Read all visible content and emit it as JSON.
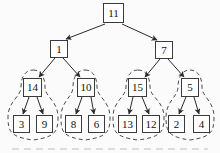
{
  "colors": {
    "ink": "#2a2a2a",
    "box_border": "#3b3b3b",
    "background": "#fbfbfb",
    "group_outline": "#4a4a4a"
  },
  "tree": {
    "type": "binary-tree-diagram",
    "nodes": {
      "n11": "11",
      "n1": "1",
      "n7": "7",
      "n14": "14",
      "n10": "10",
      "n15": "15",
      "n5": "5",
      "n3": "3",
      "n9": "9",
      "n8": "8",
      "n6": "6",
      "n13": "13",
      "n12": "12",
      "n2": "2",
      "n4": "4"
    },
    "edges": [
      [
        "11",
        "1"
      ],
      [
        "11",
        "7"
      ],
      [
        "1",
        "14"
      ],
      [
        "1",
        "10"
      ],
      [
        "7",
        "15"
      ],
      [
        "7",
        "5"
      ],
      [
        "14",
        "3"
      ],
      [
        "14",
        "9"
      ],
      [
        "10",
        "8"
      ],
      [
        "10",
        "6"
      ],
      [
        "15",
        "13"
      ],
      [
        "15",
        "12"
      ],
      [
        "5",
        "2"
      ],
      [
        "5",
        "4"
      ]
    ],
    "groups": [
      [
        "14",
        "3",
        "9"
      ],
      [
        "10",
        "8",
        "6"
      ],
      [
        "15",
        "13",
        "12"
      ],
      [
        "5",
        "2",
        "4"
      ]
    ]
  }
}
